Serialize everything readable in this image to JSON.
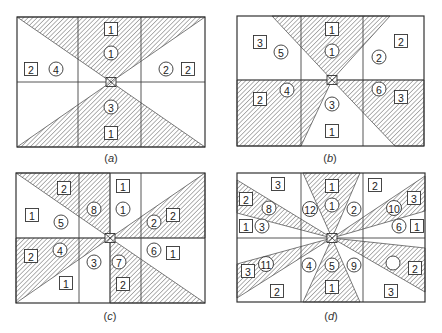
{
  "figure": {
    "width": 442,
    "height": 333,
    "colors": {
      "line": "#333333",
      "hatch": "#555555",
      "background": "#ffffff"
    }
  },
  "panels": [
    {
      "id": "a",
      "caption_open": "(",
      "caption_letter": "a",
      "caption_close": ")",
      "caption_pos": [
        111,
        162
      ],
      "frame": [
        17,
        17,
        205,
        147
      ],
      "verticals": [
        78,
        141
      ],
      "horizontals": [
        82
      ],
      "center": [
        111,
        82
      ],
      "shaded": [
        [
          [
            17,
            17
          ],
          [
            205,
            17
          ],
          [
            111,
            82
          ]
        ],
        [
          [
            17,
            147
          ],
          [
            205,
            147
          ],
          [
            111,
            82
          ]
        ]
      ],
      "squares": [
        {
          "label": "1",
          "x": 111,
          "y": 29
        },
        {
          "label": "2",
          "x": 31,
          "y": 69
        },
        {
          "label": "2",
          "x": 188,
          "y": 69
        },
        {
          "label": "1",
          "x": 111,
          "y": 133
        }
      ],
      "circles": [
        {
          "label": "1",
          "x": 111,
          "y": 53
        },
        {
          "label": "4",
          "x": 56,
          "y": 69
        },
        {
          "label": "2",
          "x": 166,
          "y": 69
        },
        {
          "label": "3",
          "x": 111,
          "y": 107
        }
      ]
    },
    {
      "id": "b",
      "caption_open": "(",
      "caption_letter": "b",
      "caption_close": ")",
      "caption_pos": [
        330,
        162
      ],
      "frame": [
        237,
        16,
        424,
        146
      ],
      "verticals": [
        301,
        363
      ],
      "horizontals": [
        80
      ],
      "center": [
        332,
        80
      ],
      "shaded": [
        [
          [
            272,
            16
          ],
          [
            390,
            16
          ],
          [
            332,
            80
          ]
        ],
        [
          [
            237,
            80
          ],
          [
            332,
            80
          ],
          [
            301,
            146
          ],
          [
            237,
            146
          ]
        ],
        [
          [
            332,
            80
          ],
          [
            424,
            80
          ],
          [
            424,
            146
          ],
          [
            395,
            146
          ]
        ]
      ],
      "squares": [
        {
          "label": "1",
          "x": 332,
          "y": 29
        },
        {
          "label": "3",
          "x": 260,
          "y": 42
        },
        {
          "label": "2",
          "x": 401,
          "y": 41
        },
        {
          "label": "2",
          "x": 260,
          "y": 99
        },
        {
          "label": "3",
          "x": 401,
          "y": 97
        },
        {
          "label": "1",
          "x": 332,
          "y": 131
        }
      ],
      "circles": [
        {
          "label": "5",
          "x": 281,
          "y": 52
        },
        {
          "label": "1",
          "x": 332,
          "y": 51
        },
        {
          "label": "2",
          "x": 379,
          "y": 57
        },
        {
          "label": "4",
          "x": 287,
          "y": 90
        },
        {
          "label": "6",
          "x": 379,
          "y": 89
        },
        {
          "label": "3",
          "x": 332,
          "y": 104
        }
      ]
    },
    {
      "id": "c",
      "caption_open": "(",
      "caption_letter": "c",
      "caption_close": ")",
      "caption_pos": [
        110,
        320
      ],
      "frame": [
        16,
        173,
        205,
        303
      ],
      "verticals": [
        79,
        110,
        141
      ],
      "horizontals": [
        238
      ],
      "center": [
        110,
        238
      ],
      "shaded": [
        [
          [
            16,
            173
          ],
          [
            110,
            173
          ],
          [
            110,
            238
          ]
        ],
        [
          [
            110,
            238
          ],
          [
            205,
            173
          ],
          [
            205,
            238
          ]
        ],
        [
          [
            16,
            238
          ],
          [
            110,
            238
          ],
          [
            16,
            303
          ]
        ],
        [
          [
            110,
            238
          ],
          [
            205,
            303
          ],
          [
            110,
            303
          ]
        ]
      ],
      "squares": [
        {
          "label": "2",
          "x": 64,
          "y": 188
        },
        {
          "label": "1",
          "x": 123,
          "y": 186
        },
        {
          "label": "1",
          "x": 32,
          "y": 215
        },
        {
          "label": "2",
          "x": 173,
          "y": 215
        },
        {
          "label": "2",
          "x": 31,
          "y": 256
        },
        {
          "label": "1",
          "x": 173,
          "y": 253
        },
        {
          "label": "1",
          "x": 66,
          "y": 283
        },
        {
          "label": "2",
          "x": 123,
          "y": 284
        }
      ],
      "circles": [
        {
          "label": "8",
          "x": 94,
          "y": 209
        },
        {
          "label": "1",
          "x": 123,
          "y": 209
        },
        {
          "label": "5",
          "x": 61,
          "y": 222
        },
        {
          "label": "2",
          "x": 154,
          "y": 222
        },
        {
          "label": "4",
          "x": 60,
          "y": 250
        },
        {
          "label": "6",
          "x": 154,
          "y": 250
        },
        {
          "label": "3",
          "x": 94,
          "y": 262
        },
        {
          "label": "7",
          "x": 119,
          "y": 262
        }
      ]
    },
    {
      "id": "d",
      "caption_open": "(",
      "caption_letter": "d",
      "caption_close": ")",
      "caption_pos": [
        331,
        320
      ],
      "frame": [
        237,
        173,
        425,
        302
      ],
      "verticals": [
        301,
        363
      ],
      "horizontals": [
        238
      ],
      "center": [
        332,
        238
      ],
      "shaded": [
        [
          [
            303,
            173
          ],
          [
            360,
            173
          ],
          [
            332,
            238
          ]
        ],
        [
          [
            303,
            302
          ],
          [
            360,
            302
          ],
          [
            332,
            238
          ]
        ],
        [
          [
            237,
            180
          ],
          [
            237,
            213
          ],
          [
            332,
            238
          ]
        ],
        [
          [
            237,
            264
          ],
          [
            237,
            298
          ],
          [
            332,
            238
          ]
        ],
        [
          [
            425,
            176
          ],
          [
            425,
            211
          ],
          [
            332,
            238
          ]
        ],
        [
          [
            425,
            248
          ],
          [
            425,
            292
          ],
          [
            332,
            238
          ]
        ]
      ],
      "squares": [
        {
          "label": "3",
          "x": 278,
          "y": 184
        },
        {
          "label": "1",
          "x": 332,
          "y": 186
        },
        {
          "label": "2",
          "x": 375,
          "y": 185
        },
        {
          "label": "2",
          "x": 246,
          "y": 199
        },
        {
          "label": "3",
          "x": 414,
          "y": 198
        },
        {
          "label": "1",
          "x": 246,
          "y": 226
        },
        {
          "label": "1",
          "x": 417,
          "y": 226
        },
        {
          "label": "3",
          "x": 248,
          "y": 271
        },
        {
          "label": "2",
          "x": 415,
          "y": 268
        },
        {
          "label": "2",
          "x": 277,
          "y": 291
        },
        {
          "label": "1",
          "x": 332,
          "y": 287
        },
        {
          "label": "3",
          "x": 391,
          "y": 291
        }
      ],
      "circles": [
        {
          "label": "8",
          "x": 269,
          "y": 208
        },
        {
          "label": "12",
          "x": 310,
          "y": 209
        },
        {
          "label": "1",
          "x": 332,
          "y": 205
        },
        {
          "label": "2",
          "x": 354,
          "y": 209
        },
        {
          "label": "10",
          "x": 394,
          "y": 208
        },
        {
          "label": "3",
          "x": 262,
          "y": 226
        },
        {
          "label": "6",
          "x": 399,
          "y": 226
        },
        {
          "label": "11",
          "x": 266,
          "y": 264
        },
        {
          "label": "4",
          "x": 309,
          "y": 265
        },
        {
          "label": "5",
          "x": 332,
          "y": 265
        },
        {
          "label": "9",
          "x": 354,
          "y": 265
        },
        {
          "label": "",
          "x": 393,
          "y": 263
        }
      ]
    }
  ]
}
